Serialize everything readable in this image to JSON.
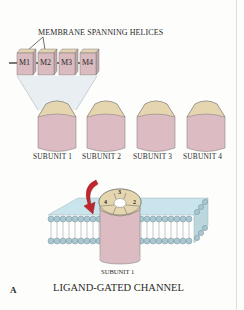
{
  "figure": {
    "panel_letter": "A",
    "caption": "LIGAND-GATED CHANNEL",
    "helices_title": "MEMBRANE SPANNING HELICES",
    "helices": [
      "M1",
      "M2",
      "M3",
      "M4"
    ],
    "subunits": [
      "SUBUNIT 1",
      "SUBUNIT 2",
      "SUBUNIT 3",
      "SUBUNIT 4"
    ],
    "assembled_label": "SUBUNIT 1",
    "channel_segment_numbers": [
      "3",
      "2",
      "4"
    ],
    "colors": {
      "subunit_body": "#d9b9bf",
      "subunit_top": "#e6d7b0",
      "membrane_top": "#c6e2ea",
      "lipid_head": "#a9c6cf",
      "arrow": "#c0262b",
      "zoom_cone": "#e6ebf0"
    }
  }
}
